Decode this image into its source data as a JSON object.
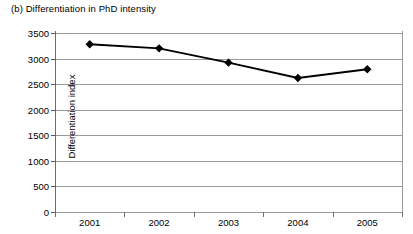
{
  "chart_data": {
    "type": "line",
    "title": "(b) Differentiation in PhD intensity",
    "xlabel": "",
    "ylabel": "Differentiation index",
    "categories": [
      "2001",
      "2002",
      "2003",
      "2004",
      "2005"
    ],
    "values": [
      3280,
      3200,
      2920,
      2620,
      2790
    ],
    "series": [
      {
        "name": "Differentiation index",
        "values": [
          3280,
          3200,
          2920,
          2620,
          2790
        ]
      }
    ],
    "ylim": [
      0,
      3500
    ],
    "y_ticks": [
      0,
      500,
      1000,
      1500,
      2000,
      2500,
      3000,
      3500
    ],
    "y_tick_labels": [
      "0",
      "500",
      "1000",
      "1500",
      "2000",
      "2500",
      "3000",
      "3500"
    ],
    "grid": true,
    "grid_axis": "y",
    "legend": false,
    "legend_position": "none",
    "marker": "diamond",
    "marker_color": "#000000",
    "line_color": "#000000"
  },
  "style": {
    "background": "#ffffff",
    "gridline_color": "#9a9a9a",
    "axis_color": "#5a5a5a",
    "text_color": "#000000"
  }
}
